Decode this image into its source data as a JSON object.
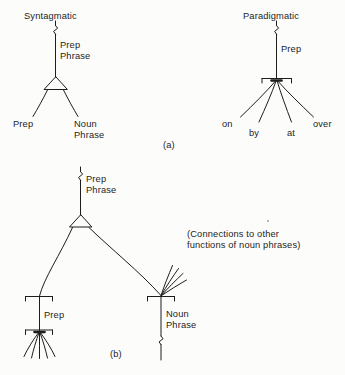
{
  "figure": {
    "background_color": "#fcfcfb",
    "ink_color": "#1d1d1d",
    "type": "linguistic-tree-diagram"
  },
  "panel_a": {
    "caption": "(a)",
    "syntagmatic": {
      "root_label": "Syntagmatic",
      "edge_label": "Prep\nPhrase",
      "node_type": "open-triangle",
      "children": [
        "Prep",
        "Noun\nPhrase"
      ]
    },
    "paradigmatic": {
      "root_label": "Paradigmatic",
      "edge_label": "Prep",
      "node_type": "bracket",
      "children": [
        "on",
        "by",
        "at",
        "over"
      ]
    }
  },
  "panel_b": {
    "caption": "(b)",
    "root_edge_label": "Prep\nPhrase",
    "node_type": "open-triangle",
    "left_branch": {
      "label": "Prep",
      "upper_node": "bracket",
      "lower_node": "bracket",
      "fan_count": 5
    },
    "right_branch": {
      "label": "Noun\nPhrase",
      "node": "bracket",
      "fan_count": 4,
      "has_continuation_squiggle": true
    },
    "annotation": "(Connections to other\nfunctions of noun phrases)"
  },
  "labels": {
    "syntagmatic": "Syntagmatic",
    "paradigmatic": "Paradigmatic",
    "prep": "Prep",
    "prep_phrase_line1": "Prep",
    "prep_phrase_line2": "Phrase",
    "noun_line1": "Noun",
    "noun_line2": "Phrase",
    "on": "on",
    "by": "by",
    "at": "at",
    "over": "over",
    "caption_a": "(a)",
    "caption_b": "(b)",
    "note_line1": "(Connections to other",
    "note_line2": "functions of noun phrases)"
  }
}
